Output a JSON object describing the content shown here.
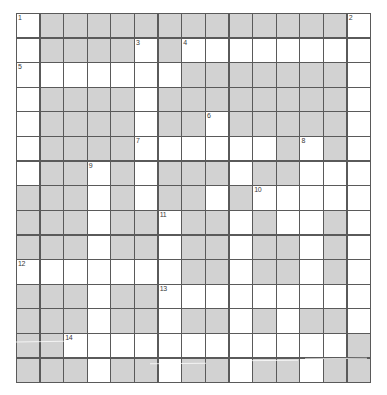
{
  "puzzle": {
    "type": "crossword-grid",
    "rows": 15,
    "columns": 15,
    "colors": {
      "open_cell": "#ffffff",
      "blocked_cell": "#d2d2d2",
      "grid_line": "#5a5a5a",
      "number_text": "#3a3a3a",
      "page_background": "#ffffff"
    },
    "legend": {
      "blocked_label": "blocked",
      "open_label": "open"
    },
    "clue_numbers": [
      {
        "number": "1",
        "row": 0,
        "col": 0
      },
      {
        "number": "2",
        "row": 0,
        "col": 14
      },
      {
        "number": "3",
        "row": 1,
        "col": 5
      },
      {
        "number": "4",
        "row": 1,
        "col": 7
      },
      {
        "number": "5",
        "row": 2,
        "col": 0
      },
      {
        "number": "6",
        "row": 4,
        "col": 8
      },
      {
        "number": "7",
        "row": 5,
        "col": 5
      },
      {
        "number": "8",
        "row": 5,
        "col": 12
      },
      {
        "number": "9",
        "row": 6,
        "col": 3
      },
      {
        "number": "10",
        "row": 7,
        "col": 10
      },
      {
        "number": "11",
        "row": 8,
        "col": 6
      },
      {
        "number": "12",
        "row": 10,
        "col": 0
      },
      {
        "number": "13",
        "row": 11,
        "col": 6
      },
      {
        "number": "14",
        "row": 13,
        "col": 2
      }
    ],
    "grid": [
      [
        0,
        1,
        1,
        1,
        1,
        1,
        1,
        1,
        1,
        1,
        1,
        1,
        1,
        1,
        0
      ],
      [
        0,
        1,
        1,
        1,
        1,
        0,
        1,
        0,
        0,
        0,
        0,
        0,
        0,
        0,
        0
      ],
      [
        0,
        0,
        0,
        0,
        0,
        0,
        0,
        1,
        1,
        1,
        1,
        1,
        1,
        1,
        0
      ],
      [
        0,
        1,
        1,
        1,
        1,
        0,
        1,
        1,
        1,
        1,
        1,
        1,
        1,
        1,
        0
      ],
      [
        0,
        1,
        1,
        1,
        1,
        0,
        1,
        1,
        0,
        1,
        1,
        1,
        1,
        1,
        0
      ],
      [
        0,
        1,
        1,
        1,
        1,
        0,
        0,
        0,
        0,
        0,
        0,
        1,
        0,
        1,
        0
      ],
      [
        0,
        1,
        1,
        0,
        1,
        0,
        1,
        1,
        1,
        0,
        1,
        1,
        0,
        0,
        0
      ],
      [
        1,
        1,
        1,
        0,
        1,
        0,
        1,
        1,
        0,
        1,
        0,
        0,
        0,
        0,
        0
      ],
      [
        1,
        1,
        1,
        0,
        1,
        1,
        0,
        1,
        1,
        0,
        1,
        0,
        0,
        1,
        0
      ],
      [
        1,
        1,
        1,
        0,
        1,
        1,
        0,
        1,
        1,
        0,
        1,
        1,
        0,
        1,
        0
      ],
      [
        0,
        0,
        0,
        0,
        0,
        0,
        0,
        1,
        1,
        0,
        1,
        1,
        0,
        1,
        0
      ],
      [
        1,
        1,
        1,
        0,
        1,
        1,
        0,
        0,
        0,
        0,
        0,
        0,
        0,
        0,
        0
      ],
      [
        1,
        1,
        1,
        0,
        1,
        1,
        0,
        1,
        1,
        0,
        1,
        0,
        1,
        1,
        0
      ],
      [
        1,
        1,
        0,
        0,
        0,
        0,
        0,
        0,
        0,
        0,
        0,
        0,
        0,
        0,
        1
      ],
      [
        1,
        1,
        1,
        0,
        1,
        1,
        0,
        1,
        1,
        0,
        1,
        1,
        0,
        1,
        1
      ]
    ]
  }
}
